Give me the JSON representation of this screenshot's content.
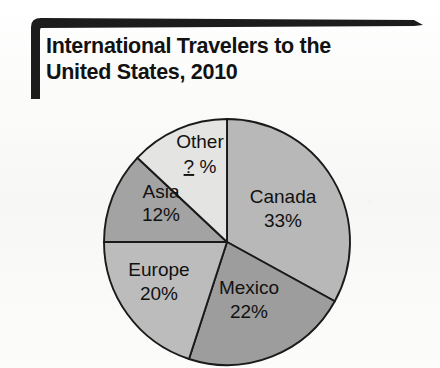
{
  "title": {
    "line1": "International Travelers to the",
    "line2": "United States, 2010"
  },
  "chart_data": {
    "type": "pie",
    "title": "International Travelers to the United States, 2010",
    "xlabel": "",
    "ylabel": "",
    "legend_position": "none",
    "labels_inside_slices": true,
    "start_angle_deg": 0,
    "direction": "clockwise",
    "unit": "%",
    "categories": [
      "Canada",
      "Mexico",
      "Europe",
      "Asia",
      "Other"
    ],
    "values": [
      33,
      22,
      20,
      12,
      null
    ],
    "value_labels": [
      "33%",
      "22%",
      "20%",
      "12%",
      "? %"
    ],
    "slices": [
      {
        "name": "Canada",
        "label": "Canada",
        "value_label": "33%",
        "value": 33,
        "color": "#b8b8b8",
        "label_x": 283,
        "label_y": 198,
        "value_x": 283,
        "value_y": 222
      },
      {
        "name": "Mexico",
        "label": "Mexico",
        "value_label": "22%",
        "value": 22,
        "color": "#9d9d9d",
        "label_x": 249,
        "label_y": 289,
        "value_x": 249,
        "value_y": 313
      },
      {
        "name": "Europe",
        "label": "Europe",
        "value_label": "20%",
        "value": 20,
        "color": "#bcbcbc",
        "label_x": 159,
        "label_y": 271,
        "value_x": 159,
        "value_y": 295
      },
      {
        "name": "Asia",
        "label": "Asia",
        "value_label": "12%",
        "value": 12,
        "color": "#a3a3a3",
        "label_x": 161,
        "label_y": 193,
        "value_x": 161,
        "value_y": 216
      },
      {
        "name": "Other",
        "label": "Other",
        "value_label": "? %",
        "value": null,
        "unknown": true,
        "color": "#e4e4e2",
        "label_x": 200,
        "label_y": 143,
        "value_x": 200,
        "value_y": 168
      }
    ],
    "annotations": [
      {
        "name": "unknown-value-marker",
        "text": "?",
        "underlined": true,
        "belongs_to": "Other"
      }
    ],
    "geometry": {
      "center_x": 227,
      "center_y": 242,
      "radius": 123
    },
    "colors": {
      "outline": "#1a1a1a",
      "background": "#fbfbfa",
      "title_text": "#121212",
      "bracket": "#1c1c1c"
    }
  }
}
